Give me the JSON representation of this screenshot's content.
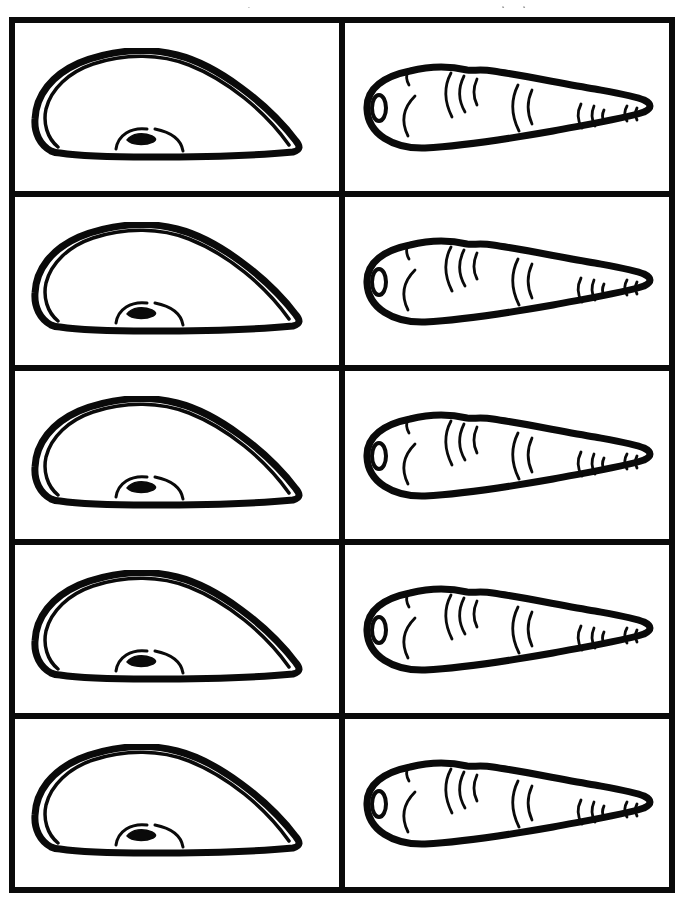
{
  "page": {
    "kind": "printable-flashcard-sheet",
    "paper_color": "#ffffff",
    "ink_color": "#0a0a0a",
    "cropped_text_color": "#9a9a9a",
    "top_text_cropped": true
  },
  "grid": {
    "rows": 5,
    "columns": 2,
    "border_color": "#0a0a0a"
  },
  "cells": {
    "left": {
      "illustration": "melon-slice"
    },
    "right": {
      "illustration": "carrot"
    }
  }
}
